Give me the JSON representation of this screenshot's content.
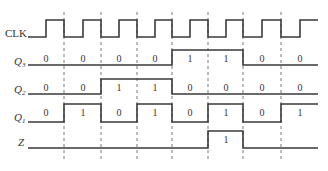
{
  "signals": [
    {
      "name": "CLK",
      "sub": ""
    },
    {
      "name": "Q",
      "sub": "3"
    },
    {
      "name": "Q",
      "sub": "2"
    },
    {
      "name": "Q",
      "sub": "1"
    },
    {
      "name": "Z",
      "sub": ""
    }
  ],
  "values": {
    "Q3": [
      "0",
      "0",
      "0",
      "0",
      "1",
      "1",
      "0",
      "0"
    ],
    "Q2": [
      "0",
      "0",
      "1",
      "1",
      "0",
      "0",
      "0",
      "0"
    ],
    "Q1": [
      "0",
      "1",
      "0",
      "1",
      "0",
      "1",
      "0",
      "1"
    ],
    "Z": [
      "",
      "",
      "",
      "",
      "",
      "1",
      "",
      ""
    ]
  },
  "colors": {
    "line": "#3a3a3a",
    "text": "#333333"
  }
}
